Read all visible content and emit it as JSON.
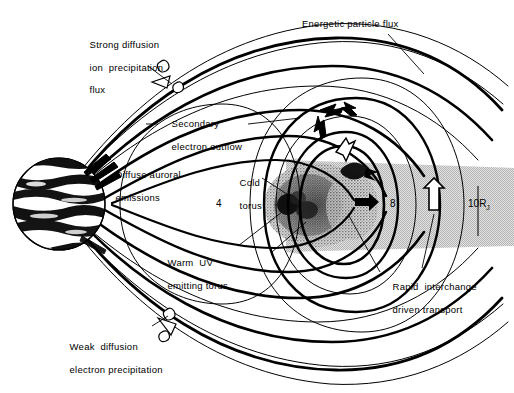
{
  "figure": {
    "width": 514,
    "height": 393,
    "background": "#ffffff",
    "ink": "#000000",
    "plasma_sheet_gray": "#c9c9c9",
    "torus_stipple_gray": "#8f8f8f",
    "torus_core_dark": "#1a1a1a"
  },
  "labels": {
    "strong_diffusion": {
      "line1": "Strong diffusion",
      "line2": "ion  precipitation",
      "line3": "flux"
    },
    "energetic_particle_flux": "Energetic particle flux",
    "secondary_electron_outflow": {
      "line1": "Secondary",
      "line2": "electron outflow"
    },
    "diffuse_auroral_emissions": {
      "line1": "Diffuse auroral",
      "line2": "emissions"
    },
    "cold_torus": {
      "line1": "Cold",
      "line2": "torus"
    },
    "warm_uv_torus": {
      "line1": "Warm  UV",
      "line2": "emitting torus"
    },
    "rapid_interchange": {
      "line1": "Rapid  interchange",
      "line2": "driven transport"
    },
    "weak_diffusion": {
      "line1": "Weak  diffusion",
      "line2": "electron precipitation"
    }
  },
  "axis_ticks": {
    "inner": "4",
    "middle": "8",
    "outer_value": "10",
    "outer_unit": "R",
    "outer_subscript": "J"
  },
  "icons": {
    "planet": "jupiter-disk",
    "loss_cone_upper": "loss-cone-arrow-upper",
    "loss_cone_lower": "loss-cone-arrow-lower",
    "interchange_arrow": "hollow-up-arrow",
    "outflow_arrow": "hollow-outflow-arrow",
    "circulation_arrows": "bold-circulation-arrows",
    "torus_core_arrow": "torus-core-arrow"
  }
}
